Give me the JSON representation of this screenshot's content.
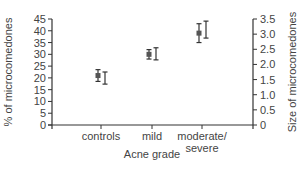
{
  "chart_data": {
    "type": "scatter",
    "title": "",
    "xlabel": "Acne grade",
    "ylabel": "% of microcomedones",
    "y2label": "Size of microcomedones",
    "categories": [
      "controls",
      "mild",
      "moderate/\nsevere"
    ],
    "category_lines": [
      [
        "controls"
      ],
      [
        "mild"
      ],
      [
        "moderate/",
        "severe"
      ]
    ],
    "ylim": [
      0,
      45
    ],
    "y2lim": [
      0,
      3.5
    ],
    "yticks": [
      "0",
      "5",
      "10",
      "15",
      "20",
      "25",
      "30",
      "35",
      "40",
      "45"
    ],
    "y2ticks": [
      "0",
      "0.5",
      "1.0",
      "1.5",
      "2.0",
      "2.5",
      "3.0",
      "3.5"
    ],
    "grid": false,
    "legend": "none",
    "series": [
      {
        "name": "% of microcomedones",
        "axis": "left",
        "marker": "filled-square",
        "values": [
          21,
          30,
          39
        ],
        "error": [
          2.5,
          2,
          4
        ]
      },
      {
        "name": "Size of microcomedones",
        "axis": "right",
        "marker": "open",
        "values": [
          1.55,
          2.35,
          3.15
        ],
        "error": [
          0.2,
          0.2,
          0.28
        ]
      }
    ]
  }
}
